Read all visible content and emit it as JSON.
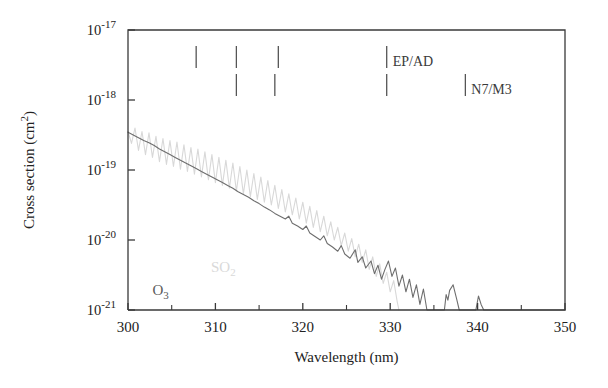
{
  "chart_data": {
    "type": "line",
    "title": "",
    "xlabel": "Wavelength (nm)",
    "ylabel": "Cross section (cm2)",
    "ylabel_display": "Cross section (cm²)",
    "xlim": [
      300,
      350
    ],
    "ylim_exponents": [
      -21,
      -17
    ],
    "yscale": "log",
    "grid": false,
    "legend_position": "inside-lower-left",
    "x_ticks_major": [
      300,
      310,
      320,
      330,
      340,
      350
    ],
    "x_ticks_major_labels": [
      "300",
      "310",
      "320",
      "330",
      "340",
      "350"
    ],
    "x_ticks_minor": [
      305,
      315,
      325,
      335,
      345
    ],
    "y_ticks_exponents": [
      -17,
      -18,
      -19,
      -20,
      -21
    ],
    "y_tick_labels": [
      "10⁻¹⁷",
      "10⁻¹⁸",
      "10⁻¹⁹",
      "10⁻²⁰",
      "10⁻²¹"
    ],
    "y_tick_base": "10",
    "y_tick_exponent_text": [
      "-17",
      "-18",
      "-19",
      "-20",
      "-21"
    ],
    "series": [
      {
        "name": "SO2",
        "label": "SO₂",
        "color": "#d8d8d8",
        "label_color": "#d9d9d9",
        "label_x": 309.5,
        "label_y_exp": -20.45,
        "points": [
          [
            300.0,
            -18.45
          ],
          [
            300.4,
            -18.62
          ],
          [
            300.8,
            -18.4
          ],
          [
            301.2,
            -18.72
          ],
          [
            301.6,
            -18.45
          ],
          [
            302.0,
            -18.78
          ],
          [
            302.4,
            -18.47
          ],
          [
            302.8,
            -18.82
          ],
          [
            303.2,
            -18.52
          ],
          [
            303.6,
            -18.88
          ],
          [
            304.0,
            -18.55
          ],
          [
            304.4,
            -18.92
          ],
          [
            304.8,
            -18.58
          ],
          [
            305.2,
            -18.95
          ],
          [
            305.6,
            -18.6
          ],
          [
            306.0,
            -18.99
          ],
          [
            306.4,
            -18.64
          ],
          [
            306.8,
            -19.02
          ],
          [
            307.2,
            -18.68
          ],
          [
            307.6,
            -19.06
          ],
          [
            308.0,
            -18.7
          ],
          [
            308.4,
            -19.1
          ],
          [
            308.8,
            -18.74
          ],
          [
            309.2,
            -19.14
          ],
          [
            309.6,
            -18.78
          ],
          [
            310.0,
            -19.18
          ],
          [
            310.4,
            -18.82
          ],
          [
            310.8,
            -19.22
          ],
          [
            311.2,
            -18.86
          ],
          [
            311.6,
            -19.26
          ],
          [
            312.0,
            -18.9
          ],
          [
            312.4,
            -19.3
          ],
          [
            312.8,
            -18.95
          ],
          [
            313.2,
            -19.34
          ],
          [
            313.6,
            -19.0
          ],
          [
            314.0,
            -19.38
          ],
          [
            314.4,
            -19.05
          ],
          [
            314.8,
            -19.42
          ],
          [
            315.2,
            -19.1
          ],
          [
            315.6,
            -19.46
          ],
          [
            316.0,
            -19.15
          ],
          [
            316.4,
            -19.5
          ],
          [
            316.8,
            -19.22
          ],
          [
            317.2,
            -19.55
          ],
          [
            317.6,
            -19.28
          ],
          [
            318.0,
            -19.6
          ],
          [
            318.4,
            -19.34
          ],
          [
            318.8,
            -19.64
          ],
          [
            319.2,
            -19.4
          ],
          [
            319.6,
            -19.7
          ],
          [
            320.0,
            -19.46
          ],
          [
            320.4,
            -19.76
          ],
          [
            320.8,
            -19.52
          ],
          [
            321.2,
            -19.82
          ],
          [
            321.6,
            -19.58
          ],
          [
            322.0,
            -19.88
          ],
          [
            322.4,
            -19.66
          ],
          [
            322.8,
            -19.94
          ],
          [
            323.2,
            -19.74
          ],
          [
            323.6,
            -20.0
          ],
          [
            324.0,
            -19.82
          ],
          [
            324.4,
            -20.08
          ],
          [
            324.8,
            -19.9
          ],
          [
            325.2,
            -20.16
          ],
          [
            325.6,
            -19.98
          ],
          [
            326.0,
            -20.24
          ],
          [
            326.4,
            -20.06
          ],
          [
            326.8,
            -20.32
          ],
          [
            327.2,
            -20.14
          ],
          [
            327.6,
            -20.42
          ],
          [
            328.0,
            -20.24
          ],
          [
            328.4,
            -20.52
          ],
          [
            328.8,
            -20.34
          ],
          [
            329.2,
            -20.62
          ],
          [
            329.6,
            -20.46
          ],
          [
            330.0,
            -20.74
          ],
          [
            330.4,
            -20.58
          ],
          [
            330.8,
            -20.88
          ],
          [
            331.0,
            -21.0
          ]
        ]
      },
      {
        "name": "O3",
        "label": "O₃",
        "color": "#6e6e6e",
        "label_color": "#5a5a5a",
        "label_x": 302.8,
        "label_y_exp": -20.78,
        "points": [
          [
            300.0,
            -18.46
          ],
          [
            300.6,
            -18.5
          ],
          [
            301.2,
            -18.54
          ],
          [
            301.8,
            -18.58
          ],
          [
            302.4,
            -18.61
          ],
          [
            303.0,
            -18.65
          ],
          [
            303.6,
            -18.7
          ],
          [
            304.2,
            -18.74
          ],
          [
            304.8,
            -18.78
          ],
          [
            305.4,
            -18.82
          ],
          [
            306.0,
            -18.86
          ],
          [
            306.6,
            -18.9
          ],
          [
            307.2,
            -18.94
          ],
          [
            307.8,
            -18.98
          ],
          [
            308.4,
            -19.02
          ],
          [
            309.0,
            -19.06
          ],
          [
            309.6,
            -19.1
          ],
          [
            310.2,
            -19.14
          ],
          [
            310.8,
            -19.18
          ],
          [
            311.4,
            -19.22
          ],
          [
            312.0,
            -19.26
          ],
          [
            312.6,
            -19.31
          ],
          [
            313.2,
            -19.35
          ],
          [
            313.8,
            -19.39
          ],
          [
            314.4,
            -19.44
          ],
          [
            315.0,
            -19.48
          ],
          [
            315.6,
            -19.53
          ],
          [
            316.2,
            -19.57
          ],
          [
            316.8,
            -19.62
          ],
          [
            317.4,
            -19.66
          ],
          [
            318.0,
            -19.7
          ],
          [
            318.4,
            -19.66
          ],
          [
            318.8,
            -19.76
          ],
          [
            319.4,
            -19.8
          ],
          [
            320.0,
            -19.85
          ],
          [
            320.4,
            -19.8
          ],
          [
            320.8,
            -19.9
          ],
          [
            321.4,
            -19.95
          ],
          [
            322.0,
            -20.0
          ],
          [
            322.4,
            -19.94
          ],
          [
            322.8,
            -20.05
          ],
          [
            323.4,
            -20.1
          ],
          [
            324.0,
            -20.16
          ],
          [
            324.4,
            -20.08
          ],
          [
            324.8,
            -20.2
          ],
          [
            325.4,
            -20.26
          ],
          [
            326.0,
            -20.14
          ],
          [
            326.3,
            -20.32
          ],
          [
            326.8,
            -20.24
          ],
          [
            327.2,
            -20.4
          ],
          [
            327.8,
            -20.3
          ],
          [
            328.2,
            -20.48
          ],
          [
            328.6,
            -20.36
          ],
          [
            329.0,
            -20.56
          ],
          [
            329.4,
            -20.42
          ],
          [
            329.8,
            -20.3
          ],
          [
            330.2,
            -20.52
          ],
          [
            330.6,
            -20.4
          ],
          [
            331.0,
            -20.66
          ],
          [
            331.4,
            -20.5
          ],
          [
            331.8,
            -20.74
          ],
          [
            332.2,
            -20.56
          ],
          [
            332.6,
            -20.82
          ],
          [
            333.0,
            -20.64
          ],
          [
            333.4,
            -20.92
          ],
          [
            333.8,
            -20.7
          ],
          [
            334.2,
            -21.0
          ],
          [
            335.0,
            -21.0
          ],
          [
            335.4,
            -21.0
          ],
          [
            336.2,
            -21.0
          ],
          [
            336.4,
            -20.78
          ],
          [
            336.6,
            -20.86
          ],
          [
            336.8,
            -20.72
          ],
          [
            337.2,
            -20.64
          ],
          [
            337.6,
            -20.84
          ],
          [
            337.9,
            -21.0
          ],
          [
            338.6,
            -21.0
          ],
          [
            339.8,
            -21.0
          ],
          [
            340.1,
            -20.8
          ],
          [
            340.4,
            -20.92
          ],
          [
            340.7,
            -21.0
          ],
          [
            350.0,
            -21.0
          ]
        ]
      }
    ],
    "annotations": [
      {
        "name": "tick-marker",
        "row": "top",
        "x": 307.8,
        "label": ""
      },
      {
        "name": "tick-marker",
        "row": "top",
        "x": 312.4,
        "label": ""
      },
      {
        "name": "tick-marker",
        "row": "top",
        "x": 317.2,
        "label": ""
      },
      {
        "name": "tick-marker",
        "row": "top",
        "x": 329.6,
        "label": "EP/AD"
      },
      {
        "name": "tick-marker",
        "row": "bottom",
        "x": 312.4,
        "label": ""
      },
      {
        "name": "tick-marker",
        "row": "bottom",
        "x": 316.8,
        "label": ""
      },
      {
        "name": "tick-marker",
        "row": "bottom",
        "x": 329.6,
        "label": ""
      },
      {
        "name": "tick-marker",
        "row": "bottom",
        "x": 338.6,
        "label": "N7/M3"
      }
    ],
    "annotation_labels": [
      "EP/AD",
      "N7/M3"
    ],
    "frame_color": "#3a3a3a",
    "background": "#ffffff"
  }
}
